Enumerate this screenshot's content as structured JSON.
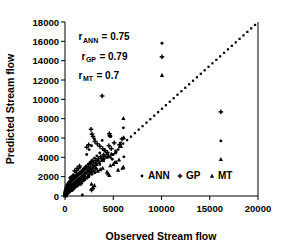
{
  "chart_data": {
    "type": "scatter",
    "title": "",
    "xlabel": "Observed Stream flow",
    "ylabel": "Predicted Stream flow",
    "xlim": [
      0,
      20000
    ],
    "ylim": [
      0,
      18000
    ],
    "xticks": [
      0,
      5000,
      10000,
      15000,
      20000
    ],
    "yticks": [
      0,
      2000,
      4000,
      6000,
      8000,
      10000,
      12000,
      14000,
      16000,
      18000
    ],
    "xtick_labels": [
      "0",
      "5000",
      "10000",
      "15000",
      "20000"
    ],
    "ytick_labels": [
      "0",
      "2000",
      "4000",
      "6000",
      "8000",
      "10000",
      "12000",
      "14000",
      "16000",
      "18000"
    ],
    "grid": false,
    "legend_position": "inside-lower-right",
    "marker_color": "#000000",
    "reference_line": {
      "name": "one-to-one-dotted-line",
      "style": "dotted",
      "x": [
        0,
        19700
      ],
      "y": [
        0,
        17700
      ]
    },
    "annotations": [
      {
        "base": "r",
        "sub": "ANN",
        "text": " = 0.75",
        "x": 1400,
        "y": 16100
      },
      {
        "base": "r",
        "sub": "GP",
        "text": " = 0.79",
        "x": 1700,
        "y": 14100
      },
      {
        "base": "r",
        "sub": "MT",
        "text": " = 0.7",
        "x": 1400,
        "y": 12100
      }
    ],
    "series": [
      {
        "name": "ANN",
        "marker": "circle",
        "points": [
          [
            10050,
            15800
          ],
          [
            16150,
            5700
          ],
          [
            6050,
            5950
          ],
          [
            5750,
            5500
          ],
          [
            4750,
            6150
          ],
          [
            6050,
            7050
          ],
          [
            4600,
            6200
          ],
          [
            3850,
            5750
          ],
          [
            3050,
            5900
          ],
          [
            2750,
            5200
          ],
          [
            2500,
            4800
          ],
          [
            2250,
            4300
          ],
          [
            4100,
            4700
          ],
          [
            4350,
            4350
          ],
          [
            4700,
            4000
          ],
          [
            5000,
            4300
          ],
          [
            5300,
            4550
          ],
          [
            3600,
            4450
          ],
          [
            3300,
            4150
          ],
          [
            3050,
            3900
          ],
          [
            2800,
            3700
          ],
          [
            2600,
            3500
          ],
          [
            2400,
            3300
          ],
          [
            2200,
            3100
          ],
          [
            2050,
            2950
          ],
          [
            1900,
            2800
          ],
          [
            1750,
            2650
          ],
          [
            1600,
            2500
          ],
          [
            1500,
            2400
          ],
          [
            1400,
            2300
          ],
          [
            1300,
            2200
          ],
          [
            1200,
            2100
          ],
          [
            1100,
            2000
          ],
          [
            1000,
            1950
          ],
          [
            950,
            1900
          ],
          [
            900,
            1850
          ],
          [
            850,
            1800
          ],
          [
            800,
            1750
          ],
          [
            750,
            1700
          ],
          [
            700,
            1650
          ],
          [
            650,
            1600
          ],
          [
            600,
            1550
          ],
          [
            560,
            1500
          ],
          [
            520,
            1450
          ],
          [
            480,
            1400
          ],
          [
            450,
            1350
          ],
          [
            420,
            1300
          ],
          [
            390,
            1250
          ],
          [
            360,
            1200
          ],
          [
            340,
            1150
          ],
          [
            320,
            1100
          ],
          [
            300,
            1050
          ],
          [
            280,
            1000
          ],
          [
            260,
            950
          ],
          [
            240,
            900
          ],
          [
            220,
            850
          ],
          [
            200,
            800
          ],
          [
            185,
            750
          ],
          [
            170,
            700
          ],
          [
            155,
            650
          ],
          [
            140,
            600
          ],
          [
            130,
            550
          ],
          [
            120,
            500
          ],
          [
            110,
            450
          ],
          [
            100,
            400
          ],
          [
            90,
            350
          ],
          [
            80,
            300
          ],
          [
            70,
            250
          ],
          [
            60,
            200
          ],
          [
            50,
            160
          ],
          [
            40,
            120
          ],
          [
            30,
            90
          ],
          [
            20,
            60
          ],
          [
            15,
            40
          ],
          [
            1850,
            2150
          ],
          [
            2100,
            2400
          ],
          [
            2350,
            2650
          ],
          [
            2650,
            2900
          ],
          [
            2950,
            3150
          ],
          [
            3200,
            3400
          ],
          [
            1450,
            1700
          ],
          [
            1650,
            1900
          ],
          [
            1250,
            1500
          ],
          [
            1050,
            1300
          ],
          [
            880,
            1100
          ],
          [
            760,
            980
          ],
          [
            640,
            860
          ],
          [
            540,
            760
          ],
          [
            460,
            660
          ],
          [
            380,
            570
          ],
          [
            310,
            490
          ],
          [
            250,
            420
          ],
          [
            2500,
            2100
          ],
          [
            2800,
            2250
          ],
          [
            3100,
            2400
          ],
          [
            1950,
            1600
          ],
          [
            1700,
            1450
          ],
          [
            1500,
            1300
          ],
          [
            1300,
            1150
          ],
          [
            1150,
            1020
          ],
          [
            980,
            880
          ],
          [
            820,
            740
          ],
          [
            690,
            620
          ],
          [
            580,
            520
          ],
          [
            490,
            440
          ],
          [
            410,
            370
          ],
          [
            345,
            310
          ],
          [
            290,
            260
          ],
          [
            1800,
            100
          ],
          [
            2400,
            1950
          ],
          [
            3400,
            3650
          ],
          [
            3750,
            3900
          ],
          [
            4050,
            4150
          ],
          [
            4900,
            3800
          ],
          [
            5200,
            3500
          ],
          [
            5500,
            4800
          ],
          [
            6100,
            4050
          ],
          [
            1150,
            2450
          ],
          [
            1350,
            2700
          ],
          [
            1550,
            2950
          ],
          [
            880,
            2200
          ],
          [
            720,
            2050
          ],
          [
            600,
            1950
          ],
          [
            500,
            1870
          ]
        ]
      },
      {
        "name": "GP",
        "marker": "plus",
        "points": [
          [
            10050,
            14400
          ],
          [
            16150,
            8700
          ],
          [
            3850,
            10350
          ],
          [
            2700,
            6900
          ],
          [
            4600,
            6450
          ],
          [
            4650,
            6250
          ],
          [
            2800,
            6400
          ],
          [
            2900,
            6150
          ],
          [
            3100,
            5650
          ],
          [
            3350,
            5400
          ],
          [
            3600,
            5150
          ],
          [
            2450,
            5300
          ],
          [
            2250,
            5050
          ],
          [
            3900,
            4900
          ],
          [
            4150,
            4700
          ],
          [
            4400,
            4500
          ],
          [
            4000,
            4250
          ],
          [
            3700,
            4050
          ],
          [
            3450,
            3850
          ],
          [
            3200,
            3650
          ],
          [
            2950,
            3450
          ],
          [
            2700,
            3250
          ],
          [
            2450,
            3050
          ],
          [
            2250,
            2900
          ],
          [
            2050,
            2750
          ],
          [
            1850,
            2600
          ],
          [
            1700,
            2450
          ],
          [
            1550,
            2350
          ],
          [
            1400,
            2250
          ],
          [
            1280,
            2150
          ],
          [
            1160,
            2050
          ],
          [
            1050,
            1980
          ],
          [
            950,
            1900
          ],
          [
            860,
            1820
          ],
          [
            780,
            1750
          ],
          [
            700,
            1680
          ],
          [
            630,
            1600
          ],
          [
            570,
            1530
          ],
          [
            510,
            1460
          ],
          [
            460,
            1390
          ],
          [
            410,
            1320
          ],
          [
            370,
            1250
          ],
          [
            330,
            1180
          ],
          [
            295,
            1110
          ],
          [
            265,
            1040
          ],
          [
            235,
            970
          ],
          [
            210,
            900
          ],
          [
            185,
            830
          ],
          [
            165,
            760
          ],
          [
            145,
            690
          ],
          [
            128,
            620
          ],
          [
            112,
            550
          ],
          [
            98,
            480
          ],
          [
            86,
            410
          ],
          [
            75,
            350
          ],
          [
            65,
            290
          ],
          [
            55,
            230
          ],
          [
            46,
            180
          ],
          [
            38,
            130
          ],
          [
            30,
            90
          ],
          [
            2600,
            2400
          ],
          [
            2900,
            2600
          ],
          [
            3200,
            2800
          ],
          [
            1950,
            2050
          ],
          [
            1700,
            1850
          ],
          [
            1480,
            1650
          ],
          [
            1280,
            1480
          ],
          [
            1100,
            1320
          ],
          [
            940,
            1180
          ],
          [
            800,
            1050
          ],
          [
            680,
            930
          ],
          [
            575,
            820
          ],
          [
            485,
            720
          ],
          [
            405,
            630
          ],
          [
            340,
            550
          ],
          [
            285,
            480
          ],
          [
            2750,
            620
          ],
          [
            2850,
            750
          ],
          [
            4550,
            5200
          ],
          [
            4800,
            4900
          ],
          [
            5100,
            5500
          ],
          [
            5650,
            5300
          ],
          [
            5900,
            5900
          ],
          [
            1500,
            3100
          ],
          [
            1250,
            2850
          ],
          [
            1000,
            2600
          ],
          [
            1350,
            1150
          ],
          [
            1650,
            1280
          ]
        ]
      },
      {
        "name": "MT",
        "marker": "triangle",
        "points": [
          [
            10050,
            12500
          ],
          [
            16150,
            3800
          ],
          [
            6050,
            8050
          ],
          [
            5950,
            2900
          ],
          [
            5600,
            3750
          ],
          [
            5300,
            3500
          ],
          [
            5000,
            3300
          ],
          [
            4700,
            3150
          ],
          [
            4500,
            4200
          ],
          [
            4250,
            4050
          ],
          [
            4000,
            3900
          ],
          [
            4800,
            4350
          ],
          [
            5200,
            4500
          ],
          [
            3800,
            3700
          ],
          [
            3550,
            3500
          ],
          [
            3300,
            3300
          ],
          [
            3100,
            3100
          ],
          [
            2900,
            2950
          ],
          [
            2700,
            2800
          ],
          [
            2500,
            2650
          ],
          [
            2300,
            2500
          ],
          [
            2150,
            2380
          ],
          [
            2000,
            2260
          ],
          [
            1850,
            2140
          ],
          [
            1700,
            2020
          ],
          [
            1570,
            1920
          ],
          [
            1440,
            1820
          ],
          [
            1320,
            1720
          ],
          [
            1200,
            1620
          ],
          [
            1090,
            1530
          ],
          [
            990,
            1440
          ],
          [
            900,
            1350
          ],
          [
            815,
            1270
          ],
          [
            735,
            1190
          ],
          [
            660,
            1110
          ],
          [
            590,
            1030
          ],
          [
            530,
            960
          ],
          [
            475,
            890
          ],
          [
            425,
            820
          ],
          [
            380,
            750
          ],
          [
            340,
            690
          ],
          [
            300,
            630
          ],
          [
            265,
            570
          ],
          [
            235,
            510
          ],
          [
            205,
            450
          ],
          [
            180,
            400
          ],
          [
            158,
            350
          ],
          [
            138,
            300
          ],
          [
            120,
            255
          ],
          [
            104,
            215
          ],
          [
            90,
            180
          ],
          [
            78,
            145
          ],
          [
            66,
            115
          ],
          [
            56,
            88
          ],
          [
            47,
            65
          ],
          [
            39,
            45
          ],
          [
            2750,
            1250
          ],
          [
            2900,
            900
          ],
          [
            3050,
            1100
          ],
          [
            4450,
            2300
          ],
          [
            4600,
            2150
          ],
          [
            5800,
            5150
          ],
          [
            6100,
            6050
          ],
          [
            2400,
            2050
          ],
          [
            2200,
            1900
          ],
          [
            2000,
            1750
          ],
          [
            1800,
            1600
          ],
          [
            1620,
            1470
          ],
          [
            1460,
            1340
          ],
          [
            1310,
            1220
          ],
          [
            1175,
            1100
          ],
          [
            1050,
            990
          ],
          [
            935,
            880
          ],
          [
            830,
            780
          ],
          [
            735,
            690
          ],
          [
            650,
            600
          ],
          [
            3400,
            2600
          ],
          [
            3650,
            2750
          ],
          [
            3900,
            2900
          ],
          [
            6050,
            3000
          ],
          [
            5500,
            2700
          ],
          [
            4350,
            2500
          ],
          [
            2650,
            3450
          ],
          [
            2850,
            3650
          ]
        ]
      }
    ]
  },
  "legend": {
    "entries": [
      {
        "label": "ANN",
        "marker": "circle"
      },
      {
        "label": "GP",
        "marker": "plus"
      },
      {
        "label": "MT",
        "marker": "triangle"
      }
    ]
  }
}
